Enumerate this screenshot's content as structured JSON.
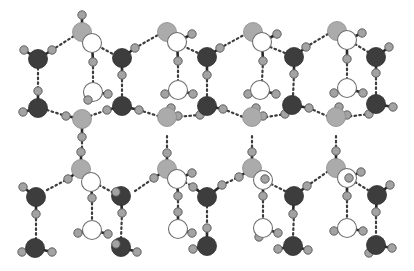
{
  "figure": {
    "width": 414,
    "height": 271,
    "colors": {
      "background": "#ffffff",
      "oxygen_dark": "#3d3d3d",
      "oxygen_grey": "#ababab",
      "oxygen_white": "#ffffff",
      "hydrogen": "#a3a3a3",
      "bond": "#2a2a2a",
      "hydrogen_bond": "#3c3c3c"
    },
    "atom_radius": {
      "oxygen": 9.5,
      "hydrogen": 4.2
    }
  },
  "molecules": [
    {
      "id": "c0-top-grey",
      "o": [
        82,
        32
      ],
      "type": "grey",
      "h": [
        [
          82,
          15
        ],
        [
          94,
          42
        ]
      ]
    },
    {
      "id": "c0-top-white",
      "o": [
        92,
        43
      ],
      "type": "white",
      "h": [
        [
          93,
          62
        ]
      ]
    },
    {
      "id": "c0-left-dark1",
      "o": [
        38,
        59
      ],
      "type": "dark",
      "h": [
        [
          24,
          50
        ],
        [
          52,
          50
        ]
      ]
    },
    {
      "id": "c0-left-dark2",
      "o": [
        38,
        108
      ],
      "type": "dark",
      "h": [
        [
          38,
          91
        ],
        [
          23,
          112
        ]
      ]
    },
    {
      "id": "c0-mid-white",
      "o": [
        93,
        92
      ],
      "type": "white",
      "h": [
        [
          88,
          100
        ],
        [
          108,
          94
        ]
      ]
    },
    {
      "id": "c0-mid-grey",
      "o": [
        82,
        119
      ],
      "type": "grey",
      "h": [
        [
          66,
          116
        ],
        [
          82,
          137
        ]
      ]
    },
    {
      "id": "c0-low-grey",
      "o": [
        81,
        169
      ],
      "type": "grey",
      "h": [
        [
          81,
          152
        ],
        [
          68,
          179
        ],
        [
          93,
          180
        ]
      ]
    },
    {
      "id": "c0-low-white",
      "o": [
        91,
        182
      ],
      "type": "white",
      "h": [
        [
          92,
          198
        ]
      ]
    },
    {
      "id": "c0-bl-dark1",
      "o": [
        36,
        197
      ],
      "type": "dark",
      "h": [
        [
          23,
          187
        ],
        [
          36,
          214
        ]
      ]
    },
    {
      "id": "c0-bl-dark2",
      "o": [
        35,
        248
      ],
      "type": "dark",
      "h": [
        [
          22,
          252
        ],
        [
          52,
          252
        ]
      ]
    },
    {
      "id": "c0-bot-white",
      "o": [
        92,
        230
      ],
      "type": "white",
      "h": [
        [
          78,
          233
        ],
        [
          108,
          234
        ]
      ]
    },
    {
      "id": "c1-top-dark",
      "o": [
        122,
        58
      ],
      "type": "dark",
      "h": [
        [
          135,
          48
        ],
        [
          122,
          75
        ]
      ]
    },
    {
      "id": "c1-mid-dark",
      "o": [
        122,
        106
      ],
      "type": "dark",
      "h": [
        [
          107,
          110
        ],
        [
          139,
          110
        ]
      ]
    },
    {
      "id": "c1-low-dark",
      "o": [
        121,
        196
      ],
      "type": "dark",
      "h": [
        [
          116,
          192
        ],
        [
          122,
          213
        ]
      ]
    },
    {
      "id": "c1-bot-dark",
      "o": [
        121,
        247
      ],
      "type": "dark",
      "h": [
        [
          116,
          244
        ],
        [
          137,
          252
        ]
      ]
    },
    {
      "id": "c1-top-grey",
      "o": [
        167,
        32
      ],
      "type": "grey",
      "h": [
        [
          180,
          42
        ]
      ]
    },
    {
      "id": "c1-top-white",
      "o": [
        177,
        42
      ],
      "type": "white",
      "h": [
        [
          192,
          34
        ],
        [
          178,
          61
        ]
      ]
    },
    {
      "id": "c1-mid-white",
      "o": [
        178,
        90
      ],
      "type": "white",
      "h": [
        [
          165,
          94
        ],
        [
          193,
          94
        ]
      ]
    },
    {
      "id": "c1-mid-grey",
      "o": [
        167,
        117
      ],
      "type": "grey",
      "h": [
        [
          171,
          108
        ],
        [
          178,
          116
        ]
      ]
    },
    {
      "id": "c1-low-grey",
      "o": [
        167,
        169
      ],
      "type": "grey",
      "h": [
        [
          167,
          153
        ],
        [
          154,
          178
        ]
      ]
    },
    {
      "id": "c1-low-white",
      "o": [
        177,
        179
      ],
      "type": "white",
      "h": [
        [
          192,
          173
        ],
        [
          178,
          196
        ]
      ]
    },
    {
      "id": "c1-bot-white",
      "o": [
        178,
        229
      ],
      "type": "white",
      "h": [
        [
          178,
          212
        ],
        [
          192,
          233
        ]
      ]
    },
    {
      "id": "c2-top-dark",
      "o": [
        207,
        57
      ],
      "type": "dark",
      "h": [
        [
          220,
          48
        ],
        [
          207,
          75
        ]
      ]
    },
    {
      "id": "c2-mid-dark",
      "o": [
        207,
        106
      ],
      "type": "dark",
      "h": [
        [
          200,
          115
        ],
        [
          223,
          109
        ]
      ]
    },
    {
      "id": "c2-low-dark",
      "o": [
        207,
        197
      ],
      "type": "dark",
      "h": [
        [
          193,
          187
        ],
        [
          222,
          185
        ]
      ]
    },
    {
      "id": "c2-bot-dark",
      "o": [
        207,
        246
      ],
      "type": "dark",
      "h": [
        [
          207,
          228
        ],
        [
          193,
          249
        ]
      ]
    },
    {
      "id": "c2-top-grey",
      "o": [
        253,
        32
      ],
      "type": "grey",
      "h": [
        [
          265,
          42
        ]
      ]
    },
    {
      "id": "c2-top-white",
      "o": [
        262,
        42
      ],
      "type": "white",
      "h": [
        [
          277,
          34
        ],
        [
          263,
          61
        ]
      ]
    },
    {
      "id": "c2-mid-white",
      "o": [
        260,
        90
      ],
      "type": "white",
      "h": [
        [
          248,
          94
        ],
        [
          276,
          94
        ]
      ]
    },
    {
      "id": "c2-mid-grey",
      "o": [
        252,
        117
      ],
      "type": "grey",
      "h": [
        [
          256,
          108
        ],
        [
          263,
          116
        ]
      ]
    },
    {
      "id": "c2-low-grey",
      "o": [
        252,
        168
      ],
      "type": "grey",
      "h": [
        [
          252,
          152
        ],
        [
          239,
          177
        ]
      ]
    },
    {
      "id": "c2-low-white",
      "o": [
        263,
        180
      ],
      "type": "white",
      "h": [
        [
          265,
          179
        ],
        [
          263,
          196
        ]
      ]
    },
    {
      "id": "c2-bot-white",
      "o": [
        263,
        228
      ],
      "type": "white",
      "h": [
        [
          259,
          237
        ],
        [
          278,
          233
        ]
      ]
    },
    {
      "id": "c3-top-dark",
      "o": [
        294,
        57
      ],
      "type": "dark",
      "h": [
        [
          306,
          47
        ],
        [
          294,
          74
        ]
      ]
    },
    {
      "id": "c3-mid-dark",
      "o": [
        292,
        105
      ],
      "type": "dark",
      "h": [
        [
          285,
          114
        ],
        [
          309,
          108
        ]
      ]
    },
    {
      "id": "c3-low-dark",
      "o": [
        294,
        196
      ],
      "type": "dark",
      "h": [
        [
          307,
          186
        ],
        [
          293,
          214
        ]
      ]
    },
    {
      "id": "c3-bot-dark",
      "o": [
        293,
        246
      ],
      "type": "dark",
      "h": [
        [
          278,
          249
        ],
        [
          308,
          250
        ]
      ]
    },
    {
      "id": "c3-top-grey",
      "o": [
        337,
        31
      ],
      "type": "grey",
      "h": [
        [
          349,
          41
        ]
      ]
    },
    {
      "id": "c3-top-white",
      "o": [
        347,
        40
      ],
      "type": "white",
      "h": [
        [
          362,
          33
        ],
        [
          347,
          59
        ]
      ]
    },
    {
      "id": "c3-mid-white",
      "o": [
        347,
        88
      ],
      "type": "white",
      "h": [
        [
          334,
          93
        ],
        [
          363,
          93
        ]
      ]
    },
    {
      "id": "c3-mid-grey",
      "o": [
        336,
        117
      ],
      "type": "grey",
      "h": [
        [
          339,
          107
        ],
        [
          347,
          115
        ]
      ]
    },
    {
      "id": "c3-low-grey",
      "o": [
        336,
        168
      ],
      "type": "grey",
      "h": [
        [
          336,
          151
        ]
      ]
    },
    {
      "id": "c3-low-white",
      "o": [
        347,
        178
      ],
      "type": "white",
      "h": [
        [
          349,
          178
        ],
        [
          361,
          172
        ],
        [
          347,
          196
        ]
      ]
    },
    {
      "id": "c3-bot-white",
      "o": [
        347,
        228
      ],
      "type": "white",
      "h": [
        [
          334,
          231
        ],
        [
          363,
          231
        ]
      ]
    },
    {
      "id": "c4-top-dark",
      "o": [
        376,
        57
      ],
      "type": "dark",
      "h": [
        [
          389,
          47
        ],
        [
          376,
          73
        ]
      ]
    },
    {
      "id": "c4-mid-dark",
      "o": [
        376,
        104
      ],
      "type": "dark",
      "h": [
        [
          369,
          114
        ],
        [
          393,
          107
        ]
      ]
    },
    {
      "id": "c4-low-dark",
      "o": [
        377,
        195
      ],
      "type": "dark",
      "h": [
        [
          390,
          185
        ],
        [
          376,
          212
        ]
      ]
    },
    {
      "id": "c4-bot-dark",
      "o": [
        376,
        245
      ],
      "type": "dark",
      "h": [
        [
          369,
          253
        ],
        [
          392,
          248
        ]
      ]
    }
  ],
  "hydrogen_bonds": [
    [
      [
        52,
        50
      ],
      [
        74,
        36
      ]
    ],
    [
      [
        38,
        68
      ],
      [
        38,
        91
      ]
    ],
    [
      [
        93,
        62
      ],
      [
        93,
        83
      ]
    ],
    [
      [
        47,
        110
      ],
      [
        66,
        116
      ]
    ],
    [
      [
        98,
        46
      ],
      [
        113,
        54
      ]
    ],
    [
      [
        122,
        75
      ],
      [
        122,
        97
      ]
    ],
    [
      [
        90,
        116
      ],
      [
        107,
        110
      ]
    ],
    [
      [
        82,
        137
      ],
      [
        82,
        152
      ]
    ],
    [
      [
        47,
        190
      ],
      [
        68,
        179
      ]
    ],
    [
      [
        36,
        214
      ],
      [
        36,
        239
      ]
    ],
    [
      [
        92,
        198
      ],
      [
        92,
        221
      ]
    ],
    [
      [
        99,
        185
      ],
      [
        112,
        192
      ]
    ],
    [
      [
        122,
        213
      ],
      [
        121,
        238
      ]
    ],
    [
      [
        135,
        48
      ],
      [
        158,
        35
      ]
    ],
    [
      [
        139,
        110
      ],
      [
        158,
        116
      ]
    ],
    [
      [
        135,
        191
      ],
      [
        154,
        178
      ]
    ],
    [
      [
        178,
        61
      ],
      [
        178,
        81
      ]
    ],
    [
      [
        183,
        46
      ],
      [
        198,
        53
      ]
    ],
    [
      [
        207,
        75
      ],
      [
        207,
        97
      ]
    ],
    [
      [
        175,
        117
      ],
      [
        200,
        115
      ]
    ],
    [
      [
        167,
        136
      ],
      [
        167,
        153
      ]
    ],
    [
      [
        178,
        196
      ],
      [
        178,
        212
      ]
    ],
    [
      [
        185,
        182
      ],
      [
        198,
        190
      ]
    ],
    [
      [
        207,
        206
      ],
      [
        207,
        228
      ]
    ],
    [
      [
        220,
        48
      ],
      [
        244,
        35
      ]
    ],
    [
      [
        223,
        109
      ],
      [
        243,
        117
      ]
    ],
    [
      [
        222,
        185
      ],
      [
        239,
        177
      ]
    ],
    [
      [
        263,
        61
      ],
      [
        262,
        81
      ]
    ],
    [
      [
        270,
        47
      ],
      [
        285,
        53
      ]
    ],
    [
      [
        294,
        74
      ],
      [
        293,
        96
      ]
    ],
    [
      [
        261,
        118
      ],
      [
        285,
        114
      ]
    ],
    [
      [
        252,
        136
      ],
      [
        252,
        152
      ]
    ],
    [
      [
        263,
        196
      ],
      [
        263,
        219
      ]
    ],
    [
      [
        271,
        184
      ],
      [
        285,
        191
      ]
    ],
    [
      [
        294,
        214
      ],
      [
        293,
        237
      ]
    ],
    [
      [
        306,
        47
      ],
      [
        328,
        34
      ]
    ],
    [
      [
        309,
        108
      ],
      [
        327,
        116
      ]
    ],
    [
      [
        307,
        186
      ],
      [
        327,
        172
      ]
    ],
    [
      [
        347,
        59
      ],
      [
        347,
        79
      ]
    ],
    [
      [
        355,
        44
      ],
      [
        368,
        52
      ]
    ],
    [
      [
        376,
        73
      ],
      [
        376,
        95
      ]
    ],
    [
      [
        345,
        117
      ],
      [
        369,
        114
      ]
    ],
    [
      [
        336,
        136
      ],
      [
        336,
        151
      ]
    ],
    [
      [
        347,
        196
      ],
      [
        347,
        219
      ]
    ],
    [
      [
        355,
        182
      ],
      [
        368,
        190
      ]
    ],
    [
      [
        376,
        212
      ],
      [
        376,
        236
      ]
    ]
  ]
}
